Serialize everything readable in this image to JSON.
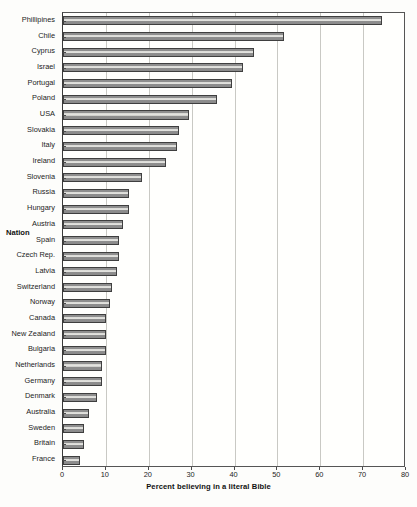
{
  "chart_data": {
    "type": "bar",
    "orientation": "horizontal",
    "title": "",
    "xlabel": "Percent believing in a literal Bible",
    "ylabel": "Nation",
    "xlim": [
      0,
      80
    ],
    "ylim": null,
    "grid": true,
    "legend": false,
    "xticks": [
      0,
      10,
      20,
      30,
      40,
      50,
      60,
      70,
      80
    ],
    "categories": [
      "Phillipines",
      "Chile",
      "Cyprus",
      "Israel",
      "Portugal",
      "Poland",
      "USA",
      "Slovakia",
      "Italy",
      "Ireland",
      "Slovenia",
      "Russia",
      "Hungary",
      "Austria",
      "Spain",
      "Czech Rep.",
      "Latvia",
      "Switzerland",
      "Norway",
      "Canada",
      "New Zealand",
      "Bulgaria",
      "Netherlands",
      "Germany",
      "Denmark",
      "Australia",
      "Sweden",
      "Britain",
      "France"
    ],
    "values": [
      74.5,
      51.5,
      44.5,
      42.0,
      39.5,
      36.0,
      29.5,
      27.0,
      26.5,
      24.0,
      18.5,
      15.5,
      15.5,
      14.0,
      13.0,
      13.0,
      12.5,
      11.5,
      11.0,
      10.0,
      10.0,
      10.0,
      9.0,
      9.0,
      8.0,
      6.0,
      5.0,
      5.0,
      4.0
    ],
    "series": [
      {
        "name": "Percent believing in a literal Bible",
        "values": [
          74.5,
          51.5,
          44.5,
          42.0,
          39.5,
          36.0,
          29.5,
          27.0,
          26.5,
          24.0,
          18.5,
          15.5,
          15.5,
          14.0,
          13.0,
          13.0,
          12.5,
          11.5,
          11.0,
          10.0,
          10.0,
          10.0,
          9.0,
          9.0,
          8.0,
          6.0,
          5.0,
          5.0,
          4.0
        ]
      }
    ],
    "colors": {
      "bar_fill": "#8e8e8e",
      "bar_highlight": "#e6e6e2",
      "bar_edge": "#3f3f3f",
      "gridline": "#c9c9c4",
      "axis": "#4a4a4a",
      "background": "#fffffd"
    }
  }
}
